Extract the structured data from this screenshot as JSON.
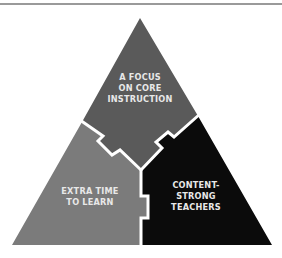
{
  "diagram": {
    "type": "interlocking-triangle",
    "colors": {
      "top_panel": "#5a5a5a",
      "left_panel": "#7b7b7b",
      "right_panel": "#0b0b0b",
      "divider": "#ffffff",
      "text": "#e8e8e8",
      "rule": "#9a9a9a"
    },
    "panels": {
      "top": {
        "lines": [
          "A FOCUS",
          "ON CORE",
          "INSTRUCTION"
        ]
      },
      "left": {
        "lines": [
          "EXTRA TIME",
          "TO LEARN"
        ]
      },
      "right": {
        "lines": [
          "CONTENT-",
          "STRONG",
          "TEACHERS"
        ]
      }
    }
  }
}
